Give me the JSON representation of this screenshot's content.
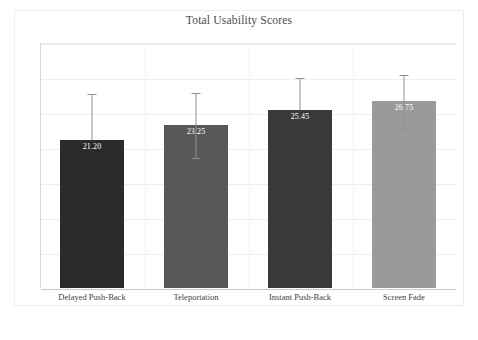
{
  "chart_data": {
    "type": "bar",
    "title": "Total Usability Scores",
    "xlabel": "",
    "ylabel": "",
    "categories": [
      "Delayed Push-Back",
      "Teleportation",
      "Instant Push-Back",
      "Screen Fade"
    ],
    "values": [
      21.2,
      23.25,
      25.45,
      26.75
    ],
    "value_labels": [
      "21.20",
      "23.25",
      "25.45",
      "26.75"
    ],
    "bar_colors": [
      "#2b2b2b",
      "#585858",
      "#3a3a3a",
      "#9a9a9a"
    ],
    "error_bars": {
      "upper": [
        27.75,
        27.85,
        29.95,
        30.45
      ],
      "lower": [
        21.2,
        18.55,
        25.45,
        22.65
      ]
    },
    "ylim": [
      0,
      35
    ],
    "yticks": [
      0,
      5,
      10,
      15,
      20,
      25,
      30,
      35
    ],
    "ytick_labels": [
      "0",
      "5",
      "10",
      "15",
      "20",
      "25",
      "30",
      "35"
    ],
    "grid": true,
    "legend": "none",
    "error_bar_color": "#8f8f8f",
    "gridline_color": "#eceff1",
    "axis_color": "#c9c9c9",
    "label_text_color": "#ffffff"
  }
}
